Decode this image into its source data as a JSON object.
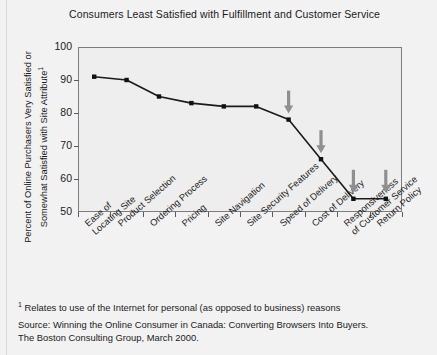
{
  "figure": {
    "title": "Consumers Least Satisfied with Fulfillment and Customer Service",
    "y_axis_title_main": "Percent of Online Purchasers Very Satisfied or Somewhat Satisfied with Site Attribute",
    "y_axis_title_footnote_marker": "1",
    "footnote_marker": "1",
    "footnote_text": "Relates to use of the Internet for personal (as opposed to business) reasons",
    "source_line_1": "Source: Winning the Online Consumer in Canada: Converting Browsers Into Buyers.",
    "source_line_2": "The Boston Consulting Group, March 2000.",
    "colors": {
      "background": "#f2f2f2",
      "plot_background": "#eeeeee",
      "frame": "#7d7d7d",
      "line": "#1a1a1a",
      "marker": "#111111",
      "arrow": "#8f8f8f",
      "text": "#1a1a1a"
    }
  },
  "chart_data": {
    "type": "line",
    "title": "Consumers Least Satisfied with Fulfillment and Customer Service",
    "xlabel": "",
    "ylabel": "Percent of Online Purchasers Very Satisfied or Somewhat Satisfied with Site Attribute",
    "ylim": [
      50,
      100
    ],
    "yticks": [
      50,
      60,
      70,
      80,
      90,
      100
    ],
    "ytick_labels": [
      "50",
      "60",
      "70",
      "80",
      "90",
      "100"
    ],
    "grid": false,
    "legend": null,
    "categories": [
      "Ease of\nLocating Site",
      "Product Selection",
      "Ordering Process",
      "Pricing",
      "Site Navigation",
      "Site Security Features",
      "Speed of Delivery",
      "Cost of Delivery",
      "Responsiveness\nof Customer Service",
      "Return Policy"
    ],
    "values": [
      91,
      90,
      85,
      83,
      82,
      82,
      78,
      66,
      54,
      54
    ],
    "annotations": [
      {
        "type": "down-arrow",
        "category": "Speed of Delivery",
        "value": 78
      },
      {
        "type": "down-arrow",
        "category": "Cost of Delivery",
        "value": 66
      },
      {
        "type": "down-arrow",
        "category": "Responsiveness of Customer Service",
        "value": 54
      },
      {
        "type": "down-arrow",
        "category": "Return Policy",
        "value": 54
      }
    ]
  }
}
